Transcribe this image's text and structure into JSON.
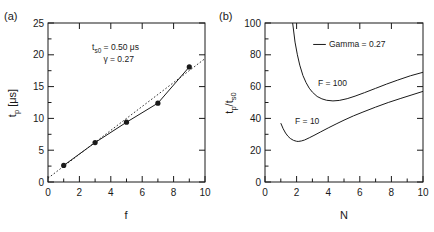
{
  "figure": {
    "panel_a_tag": "(a)",
    "panel_b_tag": "(b)"
  },
  "chart_data": [
    {
      "type": "scatter",
      "panel": "(a)",
      "title": "",
      "xlabel": "f",
      "ylabel": "t_p [μs]",
      "ylabel_parts": {
        "base": "t",
        "sub": "p",
        "unit": "[μs]"
      },
      "xlim": [
        0,
        10
      ],
      "ylim": [
        0,
        25
      ],
      "xticks": [
        0,
        2,
        4,
        6,
        8,
        10
      ],
      "yticks": [
        0,
        5,
        10,
        15,
        20,
        25
      ],
      "xtick_labels": [
        "0",
        "2",
        "4",
        "6",
        "8",
        "10"
      ],
      "ytick_labels": [
        "0",
        "5",
        "10",
        "15",
        "20",
        "25"
      ],
      "grid": false,
      "legend": "none",
      "series": [
        {
          "name": "measured",
          "marker": "filled-circle",
          "line": "solid",
          "color": "#1a1a1a",
          "x": [
            1,
            3,
            5,
            7,
            9
          ],
          "y": [
            2.6,
            6.2,
            9.4,
            12.4,
            18.1
          ]
        },
        {
          "name": "linear fit",
          "marker": "none",
          "line": "dotted",
          "color": "#1a1a1a",
          "x": [
            0,
            10
          ],
          "y": [
            0.6,
            19.4
          ]
        }
      ],
      "annotations": [
        {
          "text": "t_s0 = 0.50 μs",
          "base": "t",
          "sub": "s0",
          "rest": " = 0.50 μs",
          "x": 4.3,
          "y": 21.2
        },
        {
          "text": "γ = 0.27",
          "x": 4.5,
          "y": 19.3
        }
      ]
    },
    {
      "type": "line",
      "panel": "(b)",
      "title": "",
      "xlabel": "N",
      "ylabel": "t_p/t_s0",
      "ylabel_parts": {
        "num_base": "t",
        "num_sub": "p",
        "den_base": "t",
        "den_sub": "s0"
      },
      "xlim": [
        0,
        10
      ],
      "ylim": [
        0,
        100
      ],
      "xticks": [
        0,
        2,
        4,
        6,
        8,
        10
      ],
      "yticks": [
        0,
        20,
        40,
        60,
        80,
        100
      ],
      "xtick_labels": [
        "0",
        "2",
        "4",
        "6",
        "8",
        "10"
      ],
      "ytick_labels": [
        "0",
        "20",
        "40",
        "60",
        "80",
        "100"
      ],
      "grid": false,
      "legend": {
        "position": "top-center",
        "entries": [
          "Gamma = 0.27"
        ]
      },
      "series": [
        {
          "name": "F = 100",
          "label": "F = 100",
          "line": "solid",
          "color": "#1a1a1a",
          "x": [
            1.75,
            1.9,
            2.05,
            2.2,
            2.4,
            2.6,
            2.8,
            3.0,
            3.3,
            3.6,
            3.9,
            4.3,
            4.7,
            5.2,
            5.7,
            6.3,
            7.0,
            7.7,
            8.4,
            9.2,
            10.0
          ],
          "y": [
            100.0,
            88.0,
            80.0,
            73.5,
            67.0,
            62.5,
            59.0,
            56.5,
            53.8,
            52.3,
            51.4,
            51.0,
            51.3,
            52.4,
            54.0,
            56.2,
            58.9,
            61.6,
            64.1,
            66.8,
            69.0
          ]
        },
        {
          "name": "F = 10",
          "label": "F = 10",
          "line": "solid",
          "color": "#1a1a1a",
          "x": [
            1.0,
            1.15,
            1.3,
            1.45,
            1.6,
            1.8,
            2.0,
            2.1,
            2.3,
            2.5,
            2.8,
            3.1,
            3.5,
            4.0,
            4.5,
            5.0,
            5.6,
            6.2,
            7.0,
            7.8,
            8.6,
            9.3,
            10.0
          ],
          "y": [
            37.0,
            33.5,
            30.8,
            28.8,
            27.4,
            26.2,
            25.6,
            25.5,
            25.8,
            26.4,
            27.8,
            29.3,
            31.4,
            34.0,
            36.5,
            38.9,
            41.6,
            44.0,
            47.1,
            50.0,
            52.6,
            54.8,
            57.0
          ]
        }
      ],
      "curve_labels": [
        {
          "text": "F = 100",
          "x": 3.35,
          "y": 62.5
        },
        {
          "text": "F = 10",
          "x": 1.9,
          "y": 38.5
        }
      ],
      "legend_sample": {
        "x1": 3.05,
        "x2": 3.85,
        "y": 86.5
      },
      "legend_text": {
        "text": "Gamma = 0.27",
        "x": 4.05,
        "y": 86.5
      }
    }
  ]
}
